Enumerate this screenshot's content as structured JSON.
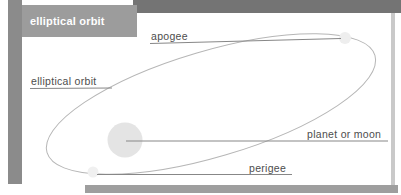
{
  "header": {
    "title": "elliptical orbit"
  },
  "diagram": {
    "labels": {
      "apogee": "apogee",
      "elliptical_orbit": "elliptical orbit",
      "planet_or_moon": "planet or moon",
      "perigee": "perigee"
    },
    "markers": {
      "planet": "planet-disc",
      "apogee_point": "apogee-point-dot",
      "perigee_point": "perigee-point-dot"
    },
    "colors": {
      "top_bar": "#747474",
      "header_box": "#9c9c9c",
      "header_text": "#ffffff",
      "left_strip": "#8b8b8b",
      "bottom_strip": "#9e9e9e",
      "right_border": "#c9c9c9",
      "ellipse_stroke": "#b6b6b6",
      "leader_line": "#878787",
      "label_text": "#4d4d4d",
      "planet_fill": "#e4e4e4",
      "point_dot_fill": "#eeeeee",
      "background": "#ffffff"
    }
  }
}
